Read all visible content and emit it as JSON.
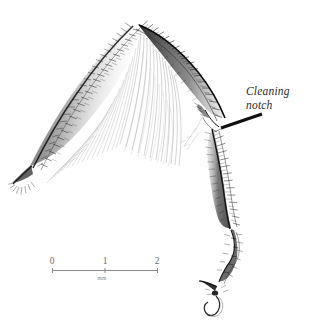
{
  "figure": {
    "kind": "scientific-illustration",
    "background_color": "#ffffff",
    "ink_color": "#1a1a1a",
    "width": 309,
    "height": 327
  },
  "annotations": [
    {
      "id": "cleaning-notch",
      "text": "Cleaning\nnotch",
      "style": "italic-serif",
      "color": "#2b2b2b",
      "leader_line": {
        "from_x": 262,
        "from_y": 114,
        "to_x": 221,
        "to_y": 128,
        "color": "#111111",
        "width": 3.2
      }
    }
  ],
  "scale_bar": {
    "ticks": [
      "0",
      "1",
      "2"
    ],
    "unit": "mm",
    "line_color": "#8a8a8a",
    "label_color": "#6b6b6b",
    "x_start": 52,
    "x_end": 158,
    "y": 270
  },
  "anatomy": {
    "parts": [
      "femur",
      "tibia",
      "tibial-spur",
      "basitarsus",
      "tarsal-segments",
      "pretarsal-claw"
    ]
  }
}
